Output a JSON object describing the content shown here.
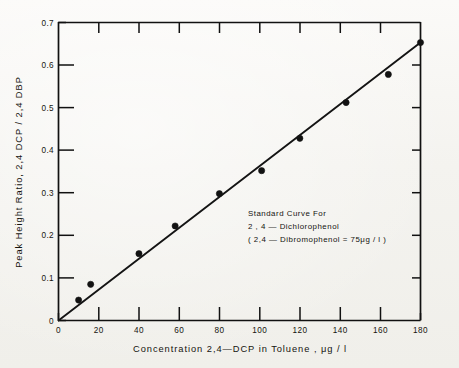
{
  "chart_data": {
    "type": "scatter",
    "title": "",
    "xlabel": "Concentration  2,4—DCP in  Toluene ,  μg / l",
    "ylabel": "Peak  Height  Ratio,  2,4 DCP / 2,4 DBP",
    "xlim": [
      0,
      180
    ],
    "ylim": [
      0,
      0.7
    ],
    "grid": false,
    "legend": "none",
    "x_ticks": [
      0,
      20,
      40,
      60,
      80,
      100,
      120,
      140,
      160,
      180
    ],
    "x_tick_labels": [
      "0",
      "20",
      "40",
      "60",
      "80",
      "100",
      "120",
      "140",
      "160",
      "180"
    ],
    "y_ticks": [
      0,
      0.1,
      0.2,
      0.3,
      0.4,
      0.5,
      0.6,
      0.7
    ],
    "y_tick_labels": [
      "0",
      "0.1",
      "0.2",
      "0.3",
      "0.4",
      "0.5",
      "0.6",
      "0.7"
    ],
    "x": [
      0,
      10,
      16,
      40,
      58,
      80,
      101,
      120,
      143,
      164,
      180
    ],
    "y": [
      0.0,
      0.048,
      0.085,
      0.157,
      0.222,
      0.298,
      0.352,
      0.428,
      0.512,
      0.578,
      0.653
    ],
    "points": [
      {
        "x": 10,
        "y": 0.048
      },
      {
        "x": 16,
        "y": 0.085
      },
      {
        "x": 40,
        "y": 0.157
      },
      {
        "x": 58,
        "y": 0.222
      },
      {
        "x": 80,
        "y": 0.298
      },
      {
        "x": 101,
        "y": 0.352
      },
      {
        "x": 120,
        "y": 0.428
      },
      {
        "x": 143,
        "y": 0.512
      },
      {
        "x": 164,
        "y": 0.578
      },
      {
        "x": 180,
        "y": 0.653
      }
    ],
    "fit_line": {
      "x0": 0,
      "y0": 0.0,
      "x1": 180,
      "y1": 0.653
    },
    "annotations": [
      "Standard  Curve  For",
      "2 , 4  —  Dichlorophenol",
      "( 2,4 — Dibromophenol = 75μg / l )"
    ]
  },
  "axis": {
    "x_title": "Concentration  2,4—DCP in  Toluene ,  μg / l",
    "y_title": "Peak  Height  Ratio,  2,4 DCP / 2,4 DBP"
  },
  "annotation": {
    "line1": "Standard  Curve  For",
    "line2": "2 , 4  —  Dichlorophenol",
    "line3": "( 2,4 — Dibromophenol = 75μg / l )"
  },
  "colors": {
    "ink": "#121212",
    "paper": "#f5f4f0"
  }
}
